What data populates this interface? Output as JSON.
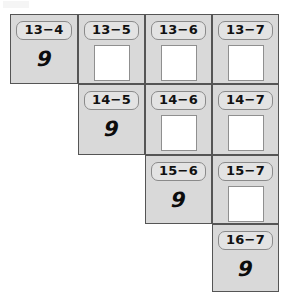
{
  "worksheet": {
    "type": "subtraction-practice-grid",
    "shape": "staircase",
    "columns": 4,
    "rows": 4,
    "colors": {
      "cell_fill": "#d9d9d9",
      "cell_border": "#555555",
      "label_fill": "#e3e3e3",
      "label_border": "#8a8a8a",
      "answer_box_fill": "#ffffff",
      "answer_box_border": "#8f8f8f",
      "ink": "#0c0c0c",
      "page_background": "#ffffff"
    },
    "cells": [
      {
        "id": "cell-13-4",
        "label": "13−4",
        "minuend": 13,
        "subtrahend": 4,
        "answer": "9",
        "filled": true,
        "row": 1,
        "col": 1,
        "x": 10,
        "y": 14,
        "w": 68,
        "h": 70
      },
      {
        "id": "cell-13-5",
        "label": "13−5",
        "minuend": 13,
        "subtrahend": 5,
        "answer": "",
        "filled": false,
        "row": 1,
        "col": 2,
        "x": 78,
        "y": 14,
        "w": 67,
        "h": 70
      },
      {
        "id": "cell-13-6",
        "label": "13−6",
        "minuend": 13,
        "subtrahend": 6,
        "answer": "",
        "filled": false,
        "row": 1,
        "col": 3,
        "x": 145,
        "y": 14,
        "w": 67,
        "h": 70
      },
      {
        "id": "cell-13-7",
        "label": "13−7",
        "minuend": 13,
        "subtrahend": 7,
        "answer": "",
        "filled": false,
        "row": 1,
        "col": 4,
        "x": 212,
        "y": 14,
        "w": 67,
        "h": 70
      },
      {
        "id": "cell-14-5",
        "label": "14−5",
        "minuend": 14,
        "subtrahend": 5,
        "answer": "9",
        "filled": true,
        "row": 2,
        "col": 2,
        "x": 78,
        "y": 84,
        "w": 67,
        "h": 71
      },
      {
        "id": "cell-14-6",
        "label": "14−6",
        "minuend": 14,
        "subtrahend": 6,
        "answer": "",
        "filled": false,
        "row": 2,
        "col": 3,
        "x": 145,
        "y": 84,
        "w": 67,
        "h": 71
      },
      {
        "id": "cell-14-7",
        "label": "14−7",
        "minuend": 14,
        "subtrahend": 7,
        "answer": "",
        "filled": false,
        "row": 2,
        "col": 4,
        "x": 212,
        "y": 84,
        "w": 67,
        "h": 71
      },
      {
        "id": "cell-15-6",
        "label": "15−6",
        "minuend": 15,
        "subtrahend": 6,
        "answer": "9",
        "filled": true,
        "row": 3,
        "col": 3,
        "x": 145,
        "y": 155,
        "w": 67,
        "h": 69
      },
      {
        "id": "cell-15-7",
        "label": "15−7",
        "minuend": 15,
        "subtrahend": 7,
        "answer": "",
        "filled": false,
        "row": 3,
        "col": 4,
        "x": 212,
        "y": 155,
        "w": 67,
        "h": 69
      },
      {
        "id": "cell-16-7",
        "label": "16−7",
        "minuend": 16,
        "subtrahend": 7,
        "answer": "9",
        "filled": true,
        "row": 4,
        "col": 4,
        "x": 212,
        "y": 224,
        "w": 67,
        "h": 68
      }
    ]
  }
}
